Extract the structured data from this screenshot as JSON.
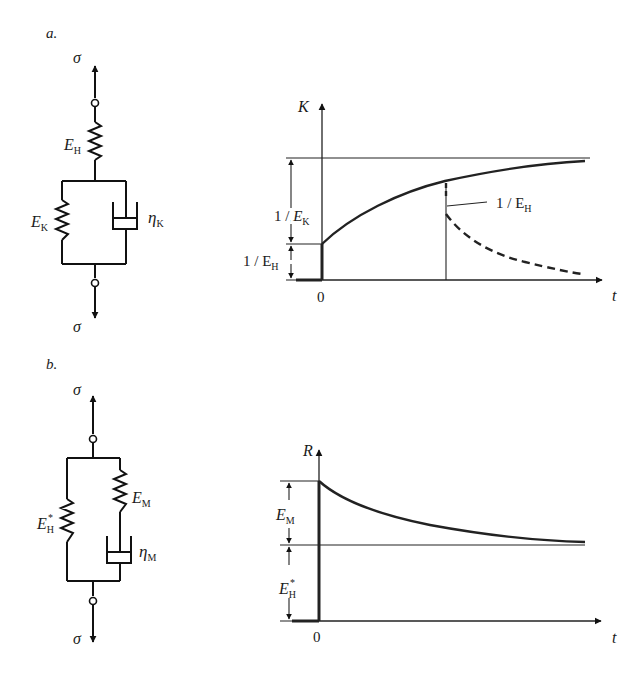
{
  "panel_a": {
    "label": "a.",
    "model": {
      "top_force": "σ",
      "bottom_force": "σ",
      "series_spring": {
        "symbol": "E",
        "sub": "H"
      },
      "parallel_spring": {
        "symbol": "E",
        "sub": "K"
      },
      "parallel_dashpot": {
        "symbol": "η",
        "sub": "K"
      }
    },
    "graph": {
      "y_axis_label": "K",
      "x_axis_label": "t",
      "origin_label": "0",
      "dim_upper": {
        "prefix": "1 / ",
        "symbol": "E",
        "sub": "K"
      },
      "dim_lower": {
        "prefix": "1 / E",
        "sub": "H"
      },
      "unload_label": {
        "prefix": "1 / E",
        "sub": "H"
      }
    }
  },
  "panel_b": {
    "label": "b.",
    "model": {
      "top_force": "σ",
      "bottom_force": "σ",
      "parallel_spring": {
        "symbol": "E",
        "sub": "H",
        "sup": "*"
      },
      "series_spring": {
        "symbol": "E",
        "sub": "M"
      },
      "series_dashpot": {
        "symbol": "η",
        "sub": "M"
      }
    },
    "graph": {
      "y_axis_label": "R",
      "x_axis_label": "t",
      "origin_label": "0",
      "dim_upper": {
        "symbol": "E",
        "sub": "M"
      },
      "dim_lower": {
        "symbol": "E",
        "sub": "H",
        "sup": "*"
      }
    }
  }
}
